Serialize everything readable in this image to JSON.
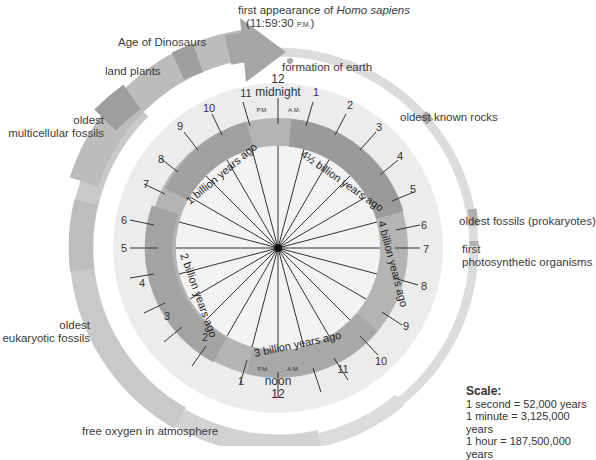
{
  "clock": {
    "top_hour": "12",
    "top_label": "midnight",
    "bottom_hour": "12",
    "bottom_label": "noon",
    "pm": "P.M.",
    "am": "A.M.",
    "right_hours": [
      "1",
      "2",
      "3",
      "4",
      "5",
      "6",
      "7",
      "8",
      "9",
      "10",
      "11"
    ],
    "left_hours": [
      "11",
      "10",
      "9",
      "8",
      "7",
      "6",
      "5",
      "4",
      "3",
      "2",
      "1"
    ]
  },
  "bands": [
    {
      "label": "4½ billion years ago"
    },
    {
      "label": "4 billion years ago"
    },
    {
      "label": "3 billion years ago"
    },
    {
      "label": "2 billion years ago"
    },
    {
      "label": "1 billion years ago"
    }
  ],
  "events": {
    "homo_sapiens_line1_pre": "first appearance of ",
    "homo_sapiens_italic": "Homo sapiens",
    "homo_sapiens_time": "(11:59:30 ",
    "homo_sapiens_pm": "P.M.",
    "homo_sapiens_close": ")",
    "formation_of_earth": "formation of earth",
    "oldest_known_rocks": "oldest known rocks",
    "oldest_fossils": "oldest fossils (prokaryotes)",
    "first_photo_1": "first",
    "first_photo_2": "photosynthetic organisms",
    "free_oxygen": "free oxygen in atmosphere",
    "eukaryotic_1": "oldest",
    "eukaryotic_2": "eukaryotic fossils",
    "multicellular_1": "oldest",
    "multicellular_2": "multicellular fossils",
    "land_plants": "land plants",
    "age_of_dinosaurs": "Age of Dinosaurs"
  },
  "scale": {
    "title": "Scale:",
    "lines": [
      "1 second  =  52,000 years",
      "1 minute  =  3,125,000 years",
      "1 hour  =  187,500,000 years"
    ]
  },
  "colors": {
    "outer_ring": "#d3d3d3",
    "outer_ring_dark": "#b8b8b8",
    "clock_face": "#ececec",
    "band_dark": "#9a9a9a",
    "band_mid": "#b0b0b0",
    "inner_face": "#f3f3f3"
  }
}
